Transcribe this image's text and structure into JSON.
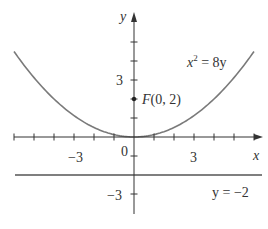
{
  "chart_data": {
    "type": "line",
    "title": "",
    "xlabel": "x",
    "ylabel": "y",
    "xlim": [
      -6.3,
      6.4
    ],
    "ylim": [
      -4.1,
      6.4
    ],
    "grid": false,
    "legend": null,
    "x_ticks": [
      -6,
      -5,
      -4,
      -3,
      -2,
      -1,
      1,
      2,
      3,
      4,
      5,
      6
    ],
    "y_ticks": [
      -3,
      -1,
      1,
      2,
      3,
      4,
      5
    ],
    "x_tick_labels": [
      {
        "value": -3,
        "label": "−3"
      },
      {
        "value": 3,
        "label": "3"
      }
    ],
    "y_tick_labels": [
      {
        "value": 3,
        "label": "3"
      },
      {
        "value": -3,
        "label": "−3"
      }
    ],
    "origin_label": "0",
    "series": [
      {
        "name": "parabola",
        "equation": "x^2 = 8y",
        "label": "x² = 8y",
        "x": [
          -6,
          -5,
          -4,
          -3,
          -2,
          -1,
          0,
          1,
          2,
          3,
          4,
          5,
          6
        ],
        "y": [
          4.5,
          3.125,
          2,
          1.125,
          0.5,
          0.125,
          0,
          0.125,
          0.5,
          1.125,
          2,
          3.125,
          4.5
        ],
        "color": "#777777"
      },
      {
        "name": "directrix",
        "equation": "y = -2",
        "label": "y = −2",
        "x": [
          -6,
          6.3
        ],
        "y": [
          -2,
          -2
        ],
        "color": "#555555"
      }
    ],
    "points": [
      {
        "name": "focus",
        "x": 0,
        "y": 2,
        "label": "F(0, 2)"
      }
    ],
    "annotations": [
      {
        "text": "x² = 8y",
        "near": "parabola upper right"
      },
      {
        "text": "F(0, 2)",
        "near": "focus point"
      },
      {
        "text": "y = −2",
        "near": "directrix right end"
      }
    ]
  },
  "labels": {
    "x_axis": "x",
    "y_axis": "y",
    "origin": "0",
    "x_neg3": "−3",
    "x_pos3": "3",
    "y_pos3": "3",
    "y_neg3": "−3",
    "focus": "F(0, 2)",
    "parabola_base": "x",
    "parabola_exp": "2",
    "parabola_rest": " = 8y",
    "directrix": "y = −2"
  },
  "colors": {
    "axis": "#333333",
    "curve": "#7a7a7a",
    "directrix": "#555555",
    "text": "#333333"
  },
  "layout": {
    "origin_px": [
      134,
      137
    ],
    "x_scale": 20,
    "y_scale": 19
  }
}
